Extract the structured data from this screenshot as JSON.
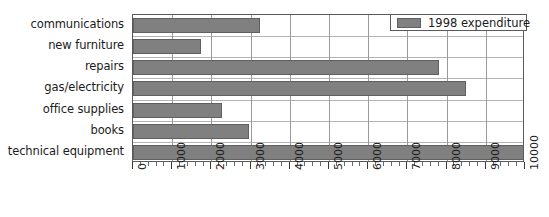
{
  "chart_data": {
    "type": "bar",
    "orientation": "horizontal",
    "title": "",
    "xlabel": "",
    "ylabel": "",
    "categories": [
      "communications",
      "new furniture",
      "repairs",
      "gas/electricity",
      "office supplies",
      "books",
      "technical equipment"
    ],
    "series": [
      {
        "name": "1998 expenditure",
        "color": "#808080",
        "values": [
          3250,
          1730,
          7800,
          8500,
          2270,
          2960,
          10000
        ]
      }
    ],
    "xlim": [
      0,
      10000
    ],
    "xticks": [
      0,
      1000,
      2000,
      3000,
      4000,
      5000,
      6000,
      7000,
      8000,
      9000,
      10000
    ],
    "xtick_labels": [
      "0",
      "1000",
      "2000",
      "3000",
      "4000",
      "5000",
      "6000",
      "7000",
      "8000",
      "9000",
      "10000"
    ],
    "xtick_label_rotation": 90,
    "minor_ticks_per_interval": 5,
    "grid": {
      "vertical": true,
      "horizontal": true,
      "vertical_color": "#9a9a9a",
      "horizontal_color": "#b4b4b4"
    },
    "legend": {
      "position": "top-right",
      "entries": [
        {
          "label": "1998 expenditure",
          "color": "#808080"
        }
      ]
    },
    "axis_color": "#5a5a5a",
    "text_color": "#1b1b1b",
    "background": "#ffffff"
  }
}
